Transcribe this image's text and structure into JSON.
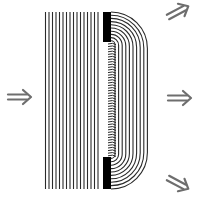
{
  "diagram": {
    "colors": {
      "background": "#ffffff",
      "wave_lines": "#2a2a2a",
      "barrier": "#000000",
      "arrows": "#6e6e6e"
    },
    "incident_waves": {
      "count": 16,
      "x_start": 45.5,
      "spacing": 3.5,
      "y_top": 12,
      "y_bottom": 189
    },
    "barrier": {
      "x": 103,
      "width": 8,
      "top_block": {
        "y": 12,
        "height": 30
      },
      "bottom_block": {
        "y": 157,
        "height": 32
      }
    },
    "diffracted_waves": {
      "count": 10,
      "slit_center_y": 100,
      "x_origin": 111
    },
    "arrows": [
      {
        "name": "incident-direction-arrow",
        "x": 8,
        "y": 97,
        "angle": 0
      },
      {
        "name": "diffracted-arrow-up-right",
        "x": 168,
        "y": 17,
        "angle": -28
      },
      {
        "name": "diffracted-arrow-right",
        "x": 168,
        "y": 98,
        "angle": 0
      },
      {
        "name": "diffracted-arrow-down-right",
        "x": 168,
        "y": 178,
        "angle": 28
      }
    ]
  }
}
